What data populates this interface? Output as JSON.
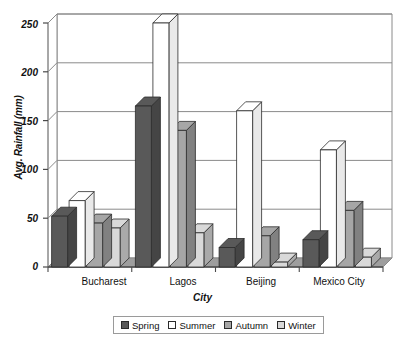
{
  "chart_data": {
    "type": "bar",
    "title": "",
    "xlabel": "City",
    "ylabel": "Avg. Rainfall (mm)",
    "categories": [
      "Bucharest",
      "Lagos",
      "Beijing",
      "Mexico City"
    ],
    "series": [
      {
        "name": "Spring",
        "color": "#595959",
        "values": [
          52,
          165,
          20,
          28
        ]
      },
      {
        "name": "Summer",
        "color": "#ffffff",
        "values": [
          68,
          250,
          160,
          120
        ]
      },
      {
        "name": "Autumn",
        "color": "#a6a6a6",
        "values": [
          45,
          140,
          32,
          58
        ]
      },
      {
        "name": "Winter",
        "color": "#d9d9d9",
        "values": [
          40,
          35,
          5,
          10
        ]
      }
    ],
    "ylim": [
      0,
      250
    ],
    "yticks": [
      0,
      50,
      100,
      150,
      200,
      250
    ],
    "ytick_labels": [
      "0",
      "50",
      "100",
      "150",
      "200",
      "250"
    ],
    "grid": true,
    "legend_position": "bottom",
    "style": "3d-column"
  },
  "axes": {
    "y_title": "Avg. Rainfall (mm)",
    "x_title": "City",
    "y_labels": [
      "250",
      "200",
      "150",
      "100",
      "50",
      "0"
    ],
    "x_labels": [
      "Bucharest",
      "Lagos",
      "Beijing",
      "Mexico City"
    ]
  },
  "legend": {
    "items": [
      {
        "label": "Spring",
        "color": "#595959"
      },
      {
        "label": "Summer",
        "color": "#ffffff"
      },
      {
        "label": "Autumn",
        "color": "#a6a6a6"
      },
      {
        "label": "Winter",
        "color": "#d9d9d9"
      }
    ]
  },
  "colors": {
    "plot_background": "#ffffff",
    "floor": "#9e9e9e",
    "wall_line": "#8a8a8a",
    "bar_outline": "#2b2b2b",
    "text": "#111111"
  }
}
